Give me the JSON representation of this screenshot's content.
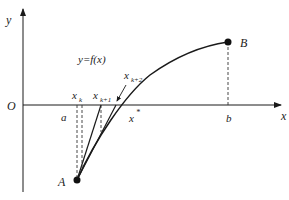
{
  "diagram": {
    "type": "newton-method-illustration",
    "colors": {
      "line": "#1a1a1a",
      "dashed": "#333333",
      "text": "#222222",
      "background": "#ffffff"
    },
    "axes": {
      "x_label": "x",
      "y_label": "y",
      "origin_label": "O"
    },
    "curve_label": "y=f(x)",
    "points": {
      "A": "A",
      "B": "B"
    },
    "ticks": {
      "a": "a",
      "b": "b",
      "x_star": "x",
      "x_star_sup": "*"
    },
    "iterates": {
      "xk": {
        "base": "x",
        "sub": "k"
      },
      "xk1": {
        "base": "x",
        "sub": "k+1"
      },
      "xk2": {
        "base": "x",
        "sub": "k+2"
      }
    }
  }
}
